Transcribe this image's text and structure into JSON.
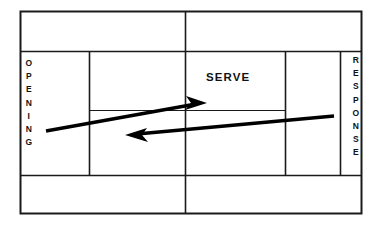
{
  "diagram": {
    "background_color": "#ffffff",
    "line_color": "#1a1a1a",
    "arrow_color": "#000000",
    "labels": {
      "serve": "SERVE",
      "opening": "OPENING",
      "response": "RESPONSE"
    },
    "arrows": [
      {
        "name": "serve-arrow",
        "direction": "right",
        "from_x": 46,
        "from_y": 131,
        "to_x": 205,
        "to_y": 103
      },
      {
        "name": "response-arrow",
        "direction": "left",
        "from_x": 334,
        "from_y": 116,
        "to_x": 126,
        "to_y": 135
      }
    ],
    "court": {
      "outer": {
        "x": 20,
        "y": 11,
        "width": 342,
        "height": 203
      },
      "baseline_top_y": 51,
      "baseline_bottom_y": 175,
      "singles_left_x": 89,
      "singles_right_x": 285,
      "net_x": 185,
      "service_line_y": 110,
      "alley_left_x": 340
    }
  }
}
